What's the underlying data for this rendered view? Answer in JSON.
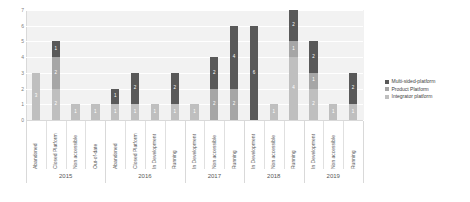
{
  "chart_data": {
    "type": "bar",
    "title": "",
    "xlabel": "",
    "ylabel": "",
    "ylim": [
      0,
      7
    ],
    "yticks": [
      "0",
      "1",
      "2",
      "3",
      "4",
      "5",
      "6",
      "7"
    ],
    "grid": true,
    "stacked": true,
    "legend_position": "right",
    "legend": [
      "Multi-sided-platform",
      "Product Platform",
      "Integrator platform"
    ],
    "colors": {
      "multi": "#595959",
      "product": "#a6a6a6",
      "integrator": "#bfbfbf",
      "plot_background": "#f2f2f2"
    },
    "group_label": "year",
    "groups": [
      {
        "year": "2015",
        "categories": [
          {
            "label": "Abandoned",
            "segments": [
              {
                "series": "Integrator platform",
                "value": 3
              }
            ],
            "total": 3
          },
          {
            "label": "Closed Platform",
            "segments": [
              {
                "series": "Multi-sided-platform",
                "value": 1
              },
              {
                "series": "Product Platform",
                "value": 2
              },
              {
                "series": "Integrator platform",
                "value": 2
              }
            ],
            "total": 5
          },
          {
            "label": "Non accessible",
            "segments": [
              {
                "series": "Integrator platform",
                "value": 1
              }
            ],
            "total": 1
          },
          {
            "label": "Out-of-date",
            "segments": [
              {
                "series": "Integrator platform",
                "value": 1
              }
            ],
            "total": 1
          }
        ]
      },
      {
        "year": "2016",
        "categories": [
          {
            "label": "Abandoned",
            "segments": [
              {
                "series": "Multi-sided-platform",
                "value": 1
              },
              {
                "series": "Integrator platform",
                "value": 1
              }
            ],
            "total": 2
          },
          {
            "label": "Closed Platform",
            "segments": [
              {
                "series": "Multi-sided-platform",
                "value": 2
              },
              {
                "series": "Integrator platform",
                "value": 1
              }
            ],
            "total": 3
          },
          {
            "label": "In Development",
            "segments": [
              {
                "series": "Integrator platform",
                "value": 1
              }
            ],
            "total": 1
          },
          {
            "label": "Running",
            "segments": [
              {
                "series": "Multi-sided-platform",
                "value": 2
              },
              {
                "series": "Integrator platform",
                "value": 1
              }
            ],
            "total": 3
          }
        ]
      },
      {
        "year": "2017",
        "categories": [
          {
            "label": "In Development",
            "segments": [
              {
                "series": "Integrator platform",
                "value": 1
              }
            ],
            "total": 1
          },
          {
            "label": "Non accessible",
            "segments": [
              {
                "series": "Multi-sided-platform",
                "value": 2
              },
              {
                "series": "Product Platform",
                "value": 2
              }
            ],
            "total": 4
          },
          {
            "label": "Running",
            "segments": [
              {
                "series": "Multi-sided-platform",
                "value": 4
              },
              {
                "series": "Product Platform",
                "value": 2
              }
            ],
            "total": 6
          }
        ]
      },
      {
        "year": "2018",
        "categories": [
          {
            "label": "In Development",
            "segments": [
              {
                "series": "Multi-sided-platform",
                "value": 6
              }
            ],
            "total": 6
          },
          {
            "label": "Non accessible",
            "segments": [
              {
                "series": "Integrator platform",
                "value": 1
              }
            ],
            "total": 1
          },
          {
            "label": "Running",
            "segments": [
              {
                "series": "Multi-sided-platform",
                "value": 2
              },
              {
                "series": "Product Platform",
                "value": 1
              },
              {
                "series": "Integrator platform",
                "value": 4
              }
            ],
            "total": 7
          }
        ]
      },
      {
        "year": "2019",
        "categories": [
          {
            "label": "In Development",
            "segments": [
              {
                "series": "Multi-sided-platform",
                "value": 2
              },
              {
                "series": "Product Platform",
                "value": 1
              },
              {
                "series": "Integrator platform",
                "value": 2
              }
            ],
            "total": 5
          },
          {
            "label": "Non accessible",
            "segments": [
              {
                "series": "Integrator platform",
                "value": 1
              }
            ],
            "total": 1
          },
          {
            "label": "Running",
            "segments": [
              {
                "series": "Multi-sided-platform",
                "value": 2
              },
              {
                "series": "Integrator platform",
                "value": 1
              }
            ],
            "total": 3
          }
        ]
      }
    ]
  }
}
